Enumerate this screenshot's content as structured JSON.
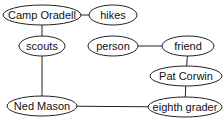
{
  "diagram": {
    "type": "semantic-network",
    "nodes": [
      {
        "id": "camp_oradell",
        "label": "Camp Oradell",
        "cx": 42,
        "cy": 15,
        "rx": 39,
        "ry": 10
      },
      {
        "id": "hikes",
        "label": "hikes",
        "cx": 113,
        "cy": 15,
        "rx": 24,
        "ry": 10
      },
      {
        "id": "scouts",
        "label": "scouts",
        "cx": 42,
        "cy": 46,
        "rx": 23,
        "ry": 10
      },
      {
        "id": "person",
        "label": "person",
        "cx": 113,
        "cy": 46,
        "rx": 25,
        "ry": 10
      },
      {
        "id": "friend",
        "label": "friend",
        "cx": 188,
        "cy": 46,
        "rx": 26,
        "ry": 10
      },
      {
        "id": "pat_corwin",
        "label": "Pat Corwin",
        "cx": 186,
        "cy": 76,
        "rx": 36,
        "ry": 10
      },
      {
        "id": "ned_mason",
        "label": "Ned Mason",
        "cx": 42,
        "cy": 106,
        "rx": 35,
        "ry": 10
      },
      {
        "id": "eighth_grader",
        "label": "eighth grader",
        "cx": 185,
        "cy": 107,
        "rx": 37,
        "ry": 10
      }
    ],
    "edges": [
      {
        "from": "camp_oradell",
        "to": "hikes"
      },
      {
        "from": "camp_oradell",
        "to": "scouts"
      },
      {
        "from": "scouts",
        "to": "ned_mason"
      },
      {
        "from": "person",
        "to": "friend"
      },
      {
        "from": "friend",
        "to": "pat_corwin"
      },
      {
        "from": "pat_corwin",
        "to": "eighth_grader"
      },
      {
        "from": "ned_mason",
        "to": "eighth_grader"
      }
    ]
  }
}
